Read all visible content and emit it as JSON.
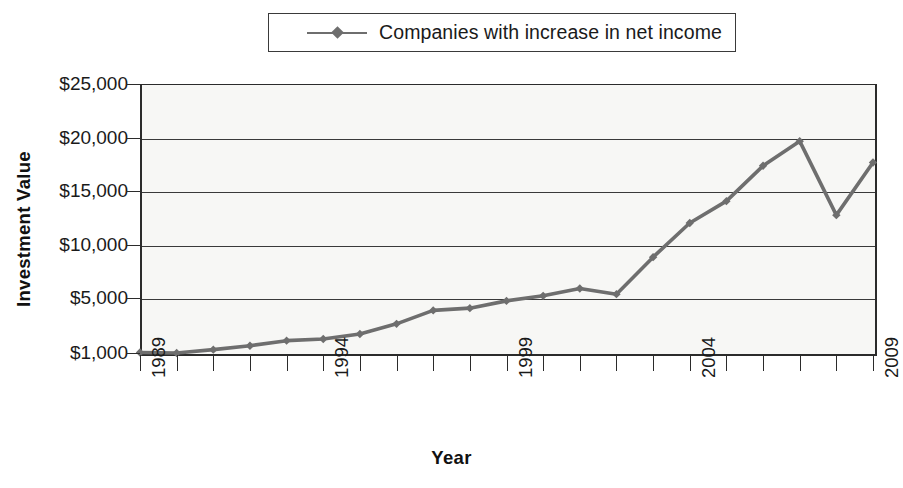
{
  "legend": {
    "entries": [
      {
        "label": "Companies with increase in net income",
        "color": "#6e6e6e",
        "marker": "diamond"
      }
    ]
  },
  "axes": {
    "y_title": "Investment Value",
    "x_title": "Year",
    "y_tick_labels": [
      "$25,000",
      "$20,000",
      "$15,000",
      "$10,000",
      "$5,000",
      "$1,000"
    ],
    "x_tick_labels": [
      "1989",
      "1994",
      "1999",
      "2004",
      "2009"
    ]
  },
  "chart_data": {
    "type": "line",
    "title": "",
    "subtitle": "",
    "xlabel": "Year",
    "ylabel": "Investment Value",
    "xlim": [
      1989,
      2009
    ],
    "ylim": [
      1000,
      25000
    ],
    "grid": true,
    "legend_position": "top-center",
    "y_ticks": [
      1000,
      5000,
      10000,
      15000,
      20000,
      25000
    ],
    "y_tick_labels": [
      "$1,000",
      "$5,000",
      "$10,000",
      "$15,000",
      "$20,000",
      "$25,000"
    ],
    "x_ticks": [
      1989,
      1990,
      1991,
      1992,
      1993,
      1994,
      1995,
      1996,
      1997,
      1998,
      1999,
      2000,
      2001,
      2002,
      2003,
      2004,
      2005,
      2006,
      2007,
      2008,
      2009
    ],
    "x_tick_labels_shown": [
      "1989",
      "1994",
      "1999",
      "2004",
      "2009"
    ],
    "x": [
      1989,
      1990,
      1991,
      1992,
      1993,
      1994,
      1995,
      1996,
      1997,
      1998,
      1999,
      2000,
      2001,
      2002,
      2003,
      2004,
      2005,
      2006,
      2007,
      2008,
      2009
    ],
    "series": [
      {
        "name": "Companies with increase in net income",
        "color": "#6e6e6e",
        "marker": "diamond",
        "values": [
          1050,
          1000,
          1300,
          1650,
          2100,
          2250,
          2700,
          3600,
          4800,
          5000,
          5650,
          6100,
          6750,
          6250,
          9550,
          12600,
          14550,
          17700,
          19900,
          13300,
          18000
        ]
      }
    ]
  }
}
